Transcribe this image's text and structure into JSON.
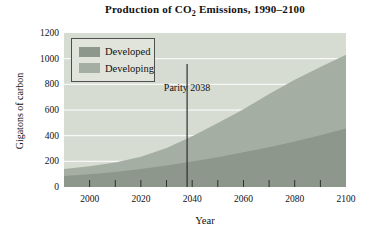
{
  "figure": {
    "title": {
      "prefix": "Production of CO",
      "subscript": "2",
      "suffix": " Emissions, 1990–2100"
    },
    "y_axis": {
      "label": "Gigatons of carbon",
      "tick_labels": [
        "1200",
        "1000",
        "800",
        "600",
        "400",
        "200",
        "0"
      ]
    },
    "x_axis": {
      "label": "Year",
      "tick_labels": [
        "2000",
        "2020",
        "2040",
        "2060",
        "2080",
        "2100"
      ]
    },
    "annotation": {
      "label": "Parity 2038",
      "year": 2038
    },
    "colors": {
      "plot_bg": "#d7dcd2",
      "grid": "#ffffff",
      "tick": "#2f2f2f",
      "parity_line": "#2f2f2f",
      "legend_bg": "#e0e4da",
      "legend_border": "#4f4f4f",
      "text": "#111111"
    }
  },
  "chart_data": {
    "type": "area",
    "stacked": true,
    "title": "Production of CO2 Emissions, 1990–2100",
    "xlabel": "Year",
    "ylabel": "Gigatons of carbon",
    "xlim": [
      1990,
      2100
    ],
    "ylim": [
      0,
      1200
    ],
    "grid": "horizontal white gridlines behind areas",
    "legend_position": "top-left inside plot",
    "x": [
      1990,
      2000,
      2010,
      2020,
      2030,
      2040,
      2050,
      2060,
      2070,
      2080,
      2090,
      2100
    ],
    "series": [
      {
        "name": "Developed",
        "color": "#8d978b",
        "stack_order": "bottom",
        "values": [
          85,
          100,
          118,
          140,
          167,
          198,
          232,
          270,
          310,
          355,
          403,
          455
        ]
      },
      {
        "name": "Developing",
        "color": "#a5aea2",
        "stack_order": "top",
        "values": [
          55,
          62,
          74,
          96,
          138,
          198,
          266,
          336,
          415,
          480,
          532,
          575
        ]
      }
    ],
    "totals": [
      140,
      162,
      192,
      236,
      305,
      396,
      498,
      606,
      725,
      835,
      935,
      1030
    ],
    "y_gridlines": [
      200,
      400,
      600,
      800,
      1000
    ],
    "minor_tick_years": [
      2000,
      2010,
      2020,
      2030,
      2040,
      2050,
      2060,
      2070,
      2080,
      2090
    ],
    "annotation": {
      "text": "Parity 2038",
      "x": 2038
    }
  }
}
